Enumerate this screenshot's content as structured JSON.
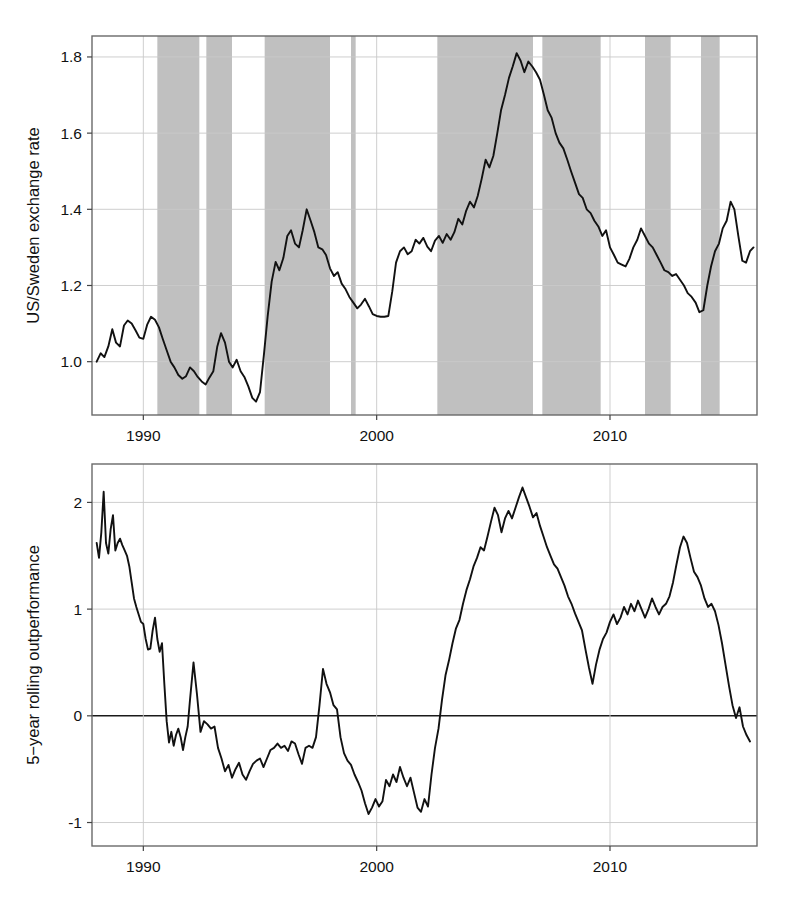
{
  "figure": {
    "title": "",
    "title_clipped": true
  },
  "chart_data": [
    {
      "id": "top-panel",
      "type": "line",
      "title": "",
      "xlabel": "",
      "ylabel": "US/Sweden exchange rate",
      "xlim": [
        1987.8,
        2016.3
      ],
      "ylim": [
        0.86,
        1.855
      ],
      "xticks": [
        1990,
        2000,
        2010
      ],
      "xticklabels": [
        "1990",
        "2000",
        "2010"
      ],
      "yticks": [
        1.0,
        1.2,
        1.4,
        1.6,
        1.8
      ],
      "yticklabels": [
        "1.0",
        "1.2",
        "1.4",
        "1.6",
        "1.8"
      ],
      "grid": true,
      "legend": "none",
      "line_color": "#111111",
      "band_color": "#c0c0c0",
      "shaded_bands": [
        [
          1990.6,
          1992.4
        ],
        [
          1992.7,
          1993.8
        ],
        [
          1995.2,
          1998.0
        ],
        [
          1998.9,
          1999.1
        ],
        [
          2002.6,
          2006.7
        ],
        [
          2007.1,
          2009.6
        ],
        [
          2011.5,
          2012.6
        ],
        [
          2013.9,
          2014.7
        ]
      ],
      "series": [
        {
          "name": "US/Sweden exchange rate",
          "x": [
            1988.0,
            1988.17,
            1988.33,
            1988.5,
            1988.67,
            1988.83,
            1989.0,
            1989.17,
            1989.33,
            1989.5,
            1989.67,
            1989.83,
            1990.0,
            1990.17,
            1990.33,
            1990.5,
            1990.67,
            1990.83,
            1991.0,
            1991.17,
            1991.33,
            1991.5,
            1991.67,
            1991.83,
            1992.0,
            1992.17,
            1992.33,
            1992.5,
            1992.67,
            1992.83,
            1993.0,
            1993.17,
            1993.33,
            1993.5,
            1993.67,
            1993.83,
            1994.0,
            1994.17,
            1994.33,
            1994.5,
            1994.67,
            1994.83,
            1995.0,
            1995.17,
            1995.33,
            1995.5,
            1995.67,
            1995.83,
            1996.0,
            1996.17,
            1996.33,
            1996.5,
            1996.67,
            1996.83,
            1997.0,
            1997.17,
            1997.33,
            1997.5,
            1997.67,
            1997.83,
            1998.0,
            1998.17,
            1998.33,
            1998.5,
            1998.67,
            1998.83,
            1999.0,
            1999.17,
            1999.33,
            1999.5,
            1999.67,
            1999.83,
            2000.0,
            2000.17,
            2000.33,
            2000.5,
            2000.67,
            2000.83,
            2001.0,
            2001.17,
            2001.33,
            2001.5,
            2001.67,
            2001.83,
            2002.0,
            2002.17,
            2002.33,
            2002.5,
            2002.67,
            2002.83,
            2003.0,
            2003.17,
            2003.33,
            2003.5,
            2003.67,
            2003.83,
            2004.0,
            2004.17,
            2004.33,
            2004.5,
            2004.67,
            2004.83,
            2005.0,
            2005.17,
            2005.33,
            2005.5,
            2005.67,
            2005.83,
            2006.0,
            2006.17,
            2006.33,
            2006.5,
            2006.67,
            2006.83,
            2007.0,
            2007.17,
            2007.33,
            2007.5,
            2007.67,
            2007.83,
            2008.0,
            2008.17,
            2008.33,
            2008.5,
            2008.67,
            2008.83,
            2009.0,
            2009.17,
            2009.33,
            2009.5,
            2009.67,
            2009.83,
            2010.0,
            2010.17,
            2010.33,
            2010.5,
            2010.67,
            2010.83,
            2011.0,
            2011.17,
            2011.33,
            2011.5,
            2011.67,
            2011.83,
            2012.0,
            2012.17,
            2012.33,
            2012.5,
            2012.67,
            2012.83,
            2013.0,
            2013.17,
            2013.33,
            2013.5,
            2013.67,
            2013.83,
            2014.0,
            2014.17,
            2014.33,
            2014.5,
            2014.67,
            2014.83,
            2015.0,
            2015.17,
            2015.33,
            2015.5,
            2015.67,
            2015.83,
            2016.0,
            2016.15
          ],
          "y": [
            1.0,
            1.022,
            1.012,
            1.04,
            1.085,
            1.05,
            1.04,
            1.095,
            1.108,
            1.1,
            1.082,
            1.063,
            1.06,
            1.098,
            1.118,
            1.11,
            1.09,
            1.06,
            1.03,
            1.0,
            0.985,
            0.965,
            0.955,
            0.962,
            0.985,
            0.975,
            0.96,
            0.948,
            0.94,
            0.958,
            0.975,
            1.04,
            1.075,
            1.05,
            1.0,
            0.985,
            1.005,
            0.975,
            0.96,
            0.935,
            0.905,
            0.895,
            0.92,
            1.02,
            1.12,
            1.21,
            1.262,
            1.24,
            1.272,
            1.33,
            1.345,
            1.31,
            1.3,
            1.345,
            1.4,
            1.37,
            1.34,
            1.3,
            1.295,
            1.28,
            1.245,
            1.225,
            1.235,
            1.205,
            1.19,
            1.17,
            1.155,
            1.14,
            1.15,
            1.165,
            1.145,
            1.125,
            1.12,
            1.118,
            1.118,
            1.12,
            1.185,
            1.26,
            1.29,
            1.3,
            1.282,
            1.29,
            1.32,
            1.31,
            1.325,
            1.302,
            1.29,
            1.318,
            1.33,
            1.312,
            1.335,
            1.32,
            1.34,
            1.375,
            1.36,
            1.395,
            1.42,
            1.405,
            1.435,
            1.48,
            1.53,
            1.51,
            1.54,
            1.6,
            1.66,
            1.7,
            1.745,
            1.775,
            1.81,
            1.79,
            1.76,
            1.788,
            1.775,
            1.76,
            1.74,
            1.7,
            1.66,
            1.64,
            1.6,
            1.575,
            1.56,
            1.53,
            1.5,
            1.47,
            1.44,
            1.43,
            1.4,
            1.39,
            1.37,
            1.355,
            1.33,
            1.345,
            1.3,
            1.28,
            1.26,
            1.255,
            1.25,
            1.27,
            1.3,
            1.32,
            1.35,
            1.33,
            1.31,
            1.3,
            1.28,
            1.26,
            1.24,
            1.235,
            1.225,
            1.23,
            1.215,
            1.2,
            1.18,
            1.17,
            1.155,
            1.13,
            1.135,
            1.2,
            1.25,
            1.29,
            1.31,
            1.35,
            1.37,
            1.42,
            1.4,
            1.33,
            1.265,
            1.26,
            1.29,
            1.3,
            1.27,
            1.23,
            1.21,
            1.195,
            1.165,
            1.15,
            1.16,
            1.19,
            1.21,
            1.22,
            1.19,
            1.165,
            1.175,
            1.17,
            1.14,
            1.125,
            1.12,
            1.115,
            1.11,
            1.09,
            1.085,
            1.09,
            1.085,
            1.095,
            1.145,
            1.22,
            1.3,
            1.37,
            1.42,
            1.4,
            1.43,
            1.395,
            1.435,
            1.42,
            1.445,
            1.438,
            1.428
          ]
        }
      ]
    },
    {
      "id": "bottom-panel",
      "type": "line",
      "title": "",
      "xlabel": "",
      "ylabel": "5−year rolling outperformance",
      "xlim": [
        1987.8,
        2016.3
      ],
      "ylim": [
        -1.22,
        2.36
      ],
      "xticks": [
        1990,
        2000,
        2010
      ],
      "xticklabels": [
        "1990",
        "2000",
        "2010"
      ],
      "yticks": [
        -1,
        0,
        1,
        2
      ],
      "yticklabels": [
        "-1",
        "0",
        "1",
        "2"
      ],
      "grid": true,
      "legend": "none",
      "line_color": "#111111",
      "zero_reference_line": 0,
      "series": [
        {
          "name": "5-year rolling outperformance",
          "x": [
            1988.0,
            1988.1,
            1988.2,
            1988.3,
            1988.4,
            1988.5,
            1988.6,
            1988.7,
            1988.8,
            1988.9,
            1989.0,
            1989.1,
            1989.2,
            1989.3,
            1989.4,
            1989.5,
            1989.6,
            1989.7,
            1989.8,
            1989.9,
            1990.0,
            1990.1,
            1990.2,
            1990.3,
            1990.4,
            1990.5,
            1990.6,
            1990.7,
            1990.8,
            1990.9,
            1991.0,
            1991.1,
            1991.2,
            1991.3,
            1991.4,
            1991.5,
            1991.6,
            1991.7,
            1991.8,
            1991.9,
            1992.0,
            1992.15,
            1992.3,
            1992.45,
            1992.6,
            1992.75,
            1992.9,
            1993.05,
            1993.2,
            1993.35,
            1993.5,
            1993.65,
            1993.8,
            1993.95,
            1994.1,
            1994.25,
            1994.4,
            1994.55,
            1994.7,
            1994.85,
            1995.0,
            1995.15,
            1995.3,
            1995.45,
            1995.6,
            1995.75,
            1995.9,
            1996.05,
            1996.2,
            1996.35,
            1996.5,
            1996.65,
            1996.8,
            1996.95,
            1997.1,
            1997.25,
            1997.4,
            1997.55,
            1997.7,
            1997.85,
            1998.0,
            1998.15,
            1998.3,
            1998.45,
            1998.6,
            1998.75,
            1998.9,
            1999.05,
            1999.2,
            1999.35,
            1999.5,
            1999.65,
            1999.8,
            1999.95,
            2000.1,
            2000.25,
            2000.4,
            2000.55,
            2000.7,
            2000.85,
            2001.0,
            2001.15,
            2001.3,
            2001.45,
            2001.6,
            2001.75,
            2001.9,
            2002.05,
            2002.2,
            2002.35,
            2002.5,
            2002.65,
            2002.8,
            2002.95,
            2003.1,
            2003.25,
            2003.4,
            2003.55,
            2003.7,
            2003.85,
            2004.0,
            2004.15,
            2004.3,
            2004.45,
            2004.6,
            2004.75,
            2004.9,
            2005.05,
            2005.2,
            2005.35,
            2005.5,
            2005.65,
            2005.8,
            2005.95,
            2006.1,
            2006.25,
            2006.4,
            2006.55,
            2006.7,
            2006.85,
            2007.0,
            2007.15,
            2007.3,
            2007.45,
            2007.6,
            2007.75,
            2007.9,
            2008.05,
            2008.2,
            2008.35,
            2008.5,
            2008.65,
            2008.8,
            2008.95,
            2009.1,
            2009.25,
            2009.4,
            2009.55,
            2009.7,
            2009.85,
            2010.0,
            2010.15,
            2010.3,
            2010.45,
            2010.6,
            2010.75,
            2010.9,
            2011.05,
            2011.2,
            2011.35,
            2011.5,
            2011.65,
            2011.8,
            2011.95,
            2012.1,
            2012.25,
            2012.4,
            2012.55,
            2012.7,
            2012.85,
            2013.0,
            2013.15,
            2013.3,
            2013.45,
            2013.6,
            2013.75,
            2013.9,
            2014.05,
            2014.2,
            2014.35,
            2014.5,
            2014.65,
            2014.8,
            2014.95,
            2015.1,
            2015.25,
            2015.4,
            2015.55,
            2015.7,
            2015.85,
            2016.0,
            2016.15
          ],
          "y": [
            1.62,
            1.48,
            1.72,
            2.1,
            1.62,
            1.52,
            1.75,
            1.88,
            1.55,
            1.62,
            1.66,
            1.6,
            1.55,
            1.5,
            1.4,
            1.25,
            1.1,
            1.02,
            0.95,
            0.88,
            0.86,
            0.72,
            0.62,
            0.63,
            0.8,
            0.92,
            0.72,
            0.6,
            0.68,
            0.3,
            -0.05,
            -0.25,
            -0.15,
            -0.28,
            -0.18,
            -0.12,
            -0.2,
            -0.32,
            -0.2,
            -0.1,
            0.15,
            0.5,
            0.2,
            -0.15,
            -0.05,
            -0.08,
            -0.12,
            -0.1,
            -0.3,
            -0.4,
            -0.52,
            -0.46,
            -0.58,
            -0.5,
            -0.44,
            -0.55,
            -0.6,
            -0.52,
            -0.45,
            -0.42,
            -0.4,
            -0.48,
            -0.4,
            -0.32,
            -0.3,
            -0.26,
            -0.3,
            -0.28,
            -0.33,
            -0.24,
            -0.26,
            -0.36,
            -0.45,
            -0.3,
            -0.28,
            -0.3,
            -0.2,
            0.1,
            0.44,
            0.3,
            0.22,
            0.1,
            0.06,
            -0.2,
            -0.35,
            -0.42,
            -0.46,
            -0.55,
            -0.62,
            -0.7,
            -0.82,
            -0.92,
            -0.86,
            -0.78,
            -0.85,
            -0.8,
            -0.6,
            -0.66,
            -0.55,
            -0.62,
            -0.48,
            -0.58,
            -0.66,
            -0.58,
            -0.72,
            -0.86,
            -0.9,
            -0.78,
            -0.85,
            -0.55,
            -0.3,
            -0.12,
            0.15,
            0.38,
            0.52,
            0.68,
            0.82,
            0.9,
            1.05,
            1.18,
            1.28,
            1.4,
            1.48,
            1.58,
            1.55,
            1.68,
            1.82,
            1.95,
            1.88,
            1.72,
            1.85,
            1.92,
            1.85,
            1.95,
            2.05,
            2.14,
            2.05,
            1.96,
            1.86,
            1.9,
            1.78,
            1.68,
            1.58,
            1.5,
            1.42,
            1.38,
            1.3,
            1.22,
            1.12,
            1.05,
            0.96,
            0.88,
            0.8,
            0.62,
            0.45,
            0.3,
            0.48,
            0.62,
            0.72,
            0.78,
            0.88,
            0.95,
            0.86,
            0.92,
            1.02,
            0.95,
            1.05,
            0.98,
            1.08,
            1.0,
            0.92,
            1.0,
            1.1,
            1.02,
            0.95,
            1.02,
            1.05,
            1.12,
            1.25,
            1.42,
            1.58,
            1.68,
            1.62,
            1.48,
            1.35,
            1.3,
            1.22,
            1.1,
            1.02,
            1.05,
            0.98,
            0.85,
            0.68,
            0.48,
            0.28,
            0.1,
            -0.02,
            0.08,
            -0.1,
            -0.18,
            -0.24
          ]
        }
      ]
    }
  ]
}
